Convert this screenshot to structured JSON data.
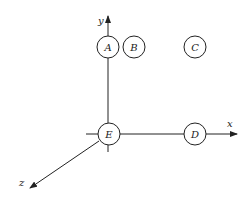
{
  "diagram": {
    "type": "3d-coordinate-axes-with-nodes",
    "colors": {
      "stroke": "#222222",
      "background": "#ffffff"
    },
    "axes": [
      {
        "id": "y",
        "label": "y",
        "direction": "up"
      },
      {
        "id": "x",
        "label": "x",
        "direction": "right"
      },
      {
        "id": "z",
        "label": "z",
        "direction": "down-left"
      }
    ],
    "nodes": [
      {
        "id": "A",
        "label": "A"
      },
      {
        "id": "B",
        "label": "B"
      },
      {
        "id": "C",
        "label": "C"
      },
      {
        "id": "D",
        "label": "D"
      },
      {
        "id": "E",
        "label": "E",
        "note": "origin"
      }
    ]
  }
}
